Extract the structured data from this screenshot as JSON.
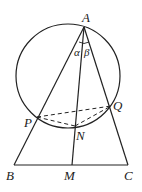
{
  "diagram": {
    "labels": {
      "A": "A",
      "B": "B",
      "C": "C",
      "M": "M",
      "N": "N",
      "P": "P",
      "Q": "Q",
      "alpha": "α",
      "beta": "β"
    },
    "points": {
      "A": [
        84,
        27
      ],
      "B": [
        14,
        165
      ],
      "C": [
        128,
        165
      ],
      "M": [
        72,
        165
      ],
      "N": [
        75,
        126
      ],
      "P": [
        37,
        117
      ],
      "Q": [
        111,
        106
      ]
    },
    "circle": {
      "cx": 68,
      "cy": 76,
      "r": 52
    },
    "colors": {
      "stroke": "#222222",
      "background": "#ffffff"
    }
  }
}
